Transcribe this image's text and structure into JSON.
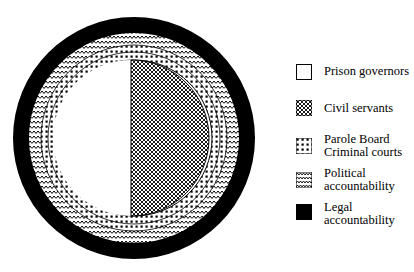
{
  "diagram": {
    "center": {
      "x": 134,
      "y": 138
    },
    "rings": [
      {
        "name": "legal-accountability",
        "r_outer": 121,
        "r_inner": 105,
        "pattern": "solid-black"
      },
      {
        "name": "political-accountability",
        "r_outer": 105,
        "r_inner": 93,
        "pattern": "zigzag"
      },
      {
        "name": "parole-board-criminal-courts",
        "r_outer": 93,
        "r_inner": 79,
        "pattern": "dots"
      }
    ],
    "core": {
      "r": 78,
      "left_half": {
        "name": "prison-governors",
        "pattern": "white"
      },
      "right_half": {
        "name": "civil-servants",
        "pattern": "crosshatch"
      }
    },
    "colors": {
      "ink": "#000000",
      "paper": "#ffffff"
    }
  },
  "legend": {
    "items": [
      {
        "key": "prison-governors",
        "label": "Prison governors",
        "pattern": "white"
      },
      {
        "key": "civil-servants",
        "label": "Civil servants",
        "pattern": "crosshatch"
      },
      {
        "key": "parole-board-criminal-courts",
        "label": "Parole Board\nCriminal courts",
        "pattern": "dots"
      },
      {
        "key": "political-accountability",
        "label": "Political\naccountability",
        "pattern": "zigzag"
      },
      {
        "key": "legal-accountability",
        "label": "Legal\naccountability",
        "pattern": "solid-black"
      }
    ]
  }
}
